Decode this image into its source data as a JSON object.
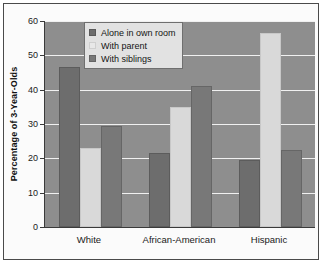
{
  "chart_data": {
    "type": "bar",
    "title": "",
    "xlabel": "",
    "ylabel": "Percentage of 3-Year-Olds",
    "ylim": [
      0,
      60
    ],
    "yticks": [
      0,
      10,
      20,
      30,
      40,
      50,
      60
    ],
    "grid": true,
    "legend_position": "top-left-inside",
    "categories": [
      "White",
      "African-American",
      "Hispanic"
    ],
    "series": [
      {
        "name": "Alone in own room",
        "color": "#6d6d6d",
        "values": [
          46.5,
          21.5,
          19.5
        ]
      },
      {
        "name": "With parent",
        "color": "#d9d9d9",
        "values": [
          23.0,
          35.0,
          56.5
        ]
      },
      {
        "name": "With siblings",
        "color": "#787878",
        "values": [
          29.5,
          41.0,
          22.5
        ]
      }
    ]
  },
  "axis": {
    "y_title": "Percentage of 3-Year-Olds",
    "y_tick_labels": [
      "60",
      "50",
      "40",
      "30",
      "20",
      "10",
      "0"
    ],
    "x_tick_labels": [
      "White",
      "African-American",
      "Hispanic"
    ]
  },
  "legend": {
    "items": [
      {
        "label": "Alone in own room"
      },
      {
        "label": "With parent"
      },
      {
        "label": "With siblings"
      }
    ]
  },
  "colors": {
    "plot_background": "#8e8e8e",
    "gridline": "#f0f0f0",
    "axis": "#3a3a3a",
    "page_background": "#ffffff",
    "frame_border": "#4a4a4a",
    "legend_background": "#e2e2e2",
    "series_alone": "#6d6d6d",
    "series_parent": "#d9d9d9",
    "series_siblings": "#787878"
  }
}
